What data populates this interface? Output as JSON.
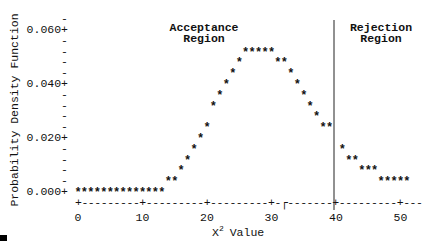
{
  "chart_data": {
    "type": "scatter",
    "style": "line-printer ascii plot (asterisk markers)",
    "title": "",
    "xlabel": "X² Value",
    "xlabel_base": "X",
    "xlabel_sup": "2",
    "xlabel_rest": " Value",
    "ylabel": "Probability Density Function",
    "xlim": [
      0,
      52
    ],
    "ylim": [
      0,
      0.064
    ],
    "x_ticks": [
      0,
      10,
      20,
      30,
      40,
      50
    ],
    "x_tick_labels": [
      "0",
      "10",
      "20",
      "30",
      "40",
      "50"
    ],
    "y_ticks": [
      0.0,
      0.02,
      0.04,
      0.06
    ],
    "y_tick_labels": [
      "0.000+",
      "0.020+",
      "0.040+",
      "0.060+"
    ],
    "y_minor_step": 0.004,
    "grid": false,
    "legend": null,
    "critical_value": 40,
    "annotations": [
      {
        "text_lines": [
          "Acceptance",
          "Region"
        ],
        "x": 20,
        "position": "top-center-left"
      },
      {
        "text_lines": [
          "Rejection",
          "Region"
        ],
        "x": 46,
        "position": "top-right"
      }
    ],
    "series": [
      {
        "name": "chi-square pdf",
        "marker": "*",
        "x": [
          0,
          1,
          2,
          3,
          4,
          5,
          6,
          7,
          8,
          9,
          10,
          11,
          12,
          13,
          14,
          15,
          16,
          17,
          18,
          19,
          20,
          21,
          22,
          23,
          24,
          25,
          26,
          27,
          28,
          29,
          30,
          31,
          32,
          33,
          34,
          35,
          36,
          37,
          38,
          39,
          41,
          42,
          43,
          44,
          45,
          46,
          47,
          48,
          49,
          50,
          51
        ],
        "y": [
          0.0,
          0.0,
          0.0,
          0.0,
          0.0,
          0.0,
          0.0,
          0.0,
          0.0,
          0.0,
          0.0,
          0.0,
          0.0,
          0.0,
          0.004,
          0.004,
          0.008,
          0.012,
          0.016,
          0.02,
          0.024,
          0.032,
          0.036,
          0.04,
          0.044,
          0.048,
          0.052,
          0.052,
          0.052,
          0.052,
          0.052,
          0.048,
          0.048,
          0.044,
          0.04,
          0.036,
          0.032,
          0.028,
          0.024,
          0.024,
          0.016,
          0.012,
          0.012,
          0.008,
          0.008,
          0.008,
          0.004,
          0.004,
          0.004,
          0.004,
          0.004
        ]
      }
    ]
  },
  "labels": {
    "acceptance_line1": "Acceptance",
    "acceptance_line2": "Region",
    "rejection_line1": "Rejection",
    "rejection_line2": "Region",
    "ylabel": "Probability Density Function",
    "xlabel_base": "X",
    "xlabel_sup": "2",
    "xlabel_rest": "Value"
  }
}
